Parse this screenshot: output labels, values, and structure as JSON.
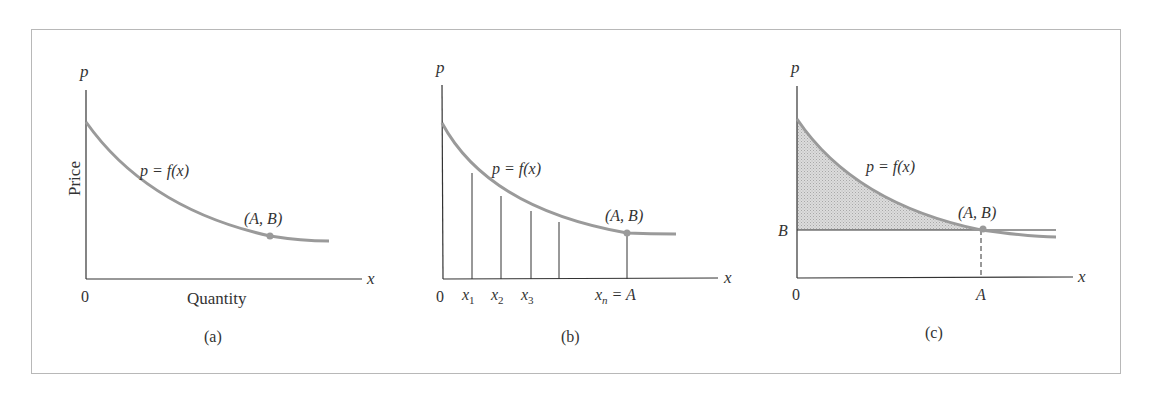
{
  "figure": {
    "panels": [
      {
        "id": "a",
        "caption": "(a)",
        "y_axis_letter": "p",
        "x_axis_letter": "x",
        "origin_label": "0",
        "y_axis_title": "Price",
        "x_axis_title": "Quantity",
        "curve_label": "p = f(x)",
        "point_label": "(A, B)"
      },
      {
        "id": "b",
        "caption": "(b)",
        "y_axis_letter": "p",
        "x_axis_letter": "x",
        "origin_label": "0",
        "curve_label": "p = f(x)",
        "point_label": "(A, B)",
        "tick_labels": {
          "x1": "x",
          "x1_sub": "1",
          "x2": "x",
          "x2_sub": "2",
          "x3": "x",
          "x3_sub": "3",
          "xn": "x",
          "xn_sub": "n",
          "xn_eq": "= A"
        }
      },
      {
        "id": "c",
        "caption": "(c)",
        "y_axis_letter": "p",
        "x_axis_letter": "x",
        "origin_label": "0",
        "curve_label": "p = f(x)",
        "point_label": "(A, B)",
        "y_tick_label": "B",
        "x_tick_label": "A"
      }
    ],
    "colors": {
      "curve": "#9a9a9a",
      "axis": "#333333",
      "shading": "#d4d4d4",
      "frame": "#b8b8b8",
      "point": "#9a9a9a"
    }
  }
}
